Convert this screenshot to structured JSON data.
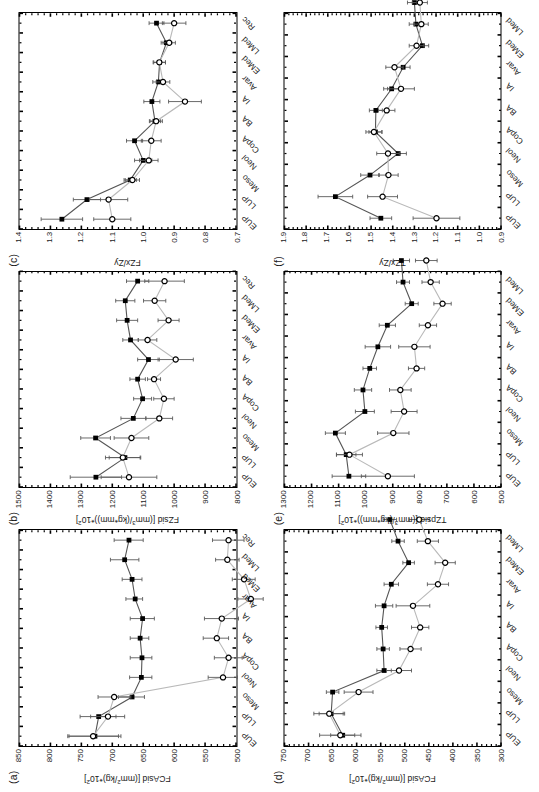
{
  "figure": {
    "rotation_note": "90-deg-ccw",
    "footer_text": "",
    "categories": [
      "EUP",
      "LUP",
      "Meso",
      "Neol",
      "CopA",
      "BA",
      "IA",
      "Avar",
      "EMed",
      "LMed",
      "Rec"
    ],
    "series_legend": [
      {
        "key": "males",
        "marker": "filled-square",
        "color": "#000000"
      },
      {
        "key": "females",
        "marker": "open-circle",
        "color": "#000000"
      }
    ]
  },
  "chart_data": [
    {
      "id": "a",
      "type": "line",
      "tag": "(a)",
      "title": "",
      "xlabel": "",
      "ylabel": "FCAsid [(mm²/kg)*10²]",
      "ylabel_base": "FCAsid [(mm",
      "ylabel_sup": "2",
      "ylabel_tail": "/kg)*10",
      "ylabel_sup2": "2",
      "ylabel_end": "]",
      "ylim": [
        500,
        850
      ],
      "yticks": [
        850,
        800,
        750,
        700,
        650,
        600,
        550,
        500
      ],
      "minor_tick_step": 10,
      "categories": [
        "EUP",
        "LUP",
        "Meso",
        "Neol",
        "CopA",
        "BA",
        "IA",
        "Avar",
        "EMed",
        "LMed",
        "Rec"
      ],
      "grid": false,
      "legend": "none",
      "series": [
        {
          "name": "males",
          "marker": "filled-square",
          "values": [
            728,
            722,
            668,
            653,
            652,
            655,
            651,
            663,
            668,
            680,
            673
          ],
          "err_low": [
            686,
            694,
            648,
            636,
            636,
            641,
            632,
            651,
            652,
            657,
            650
          ],
          "err_high": [
            770,
            752,
            690,
            672,
            671,
            671,
            671,
            678,
            684,
            703,
            697
          ]
        },
        {
          "name": "females",
          "marker": "open-circle",
          "values": [
            731,
            707,
            697,
            521,
            512,
            531,
            523,
            476,
            487,
            514,
            512
          ],
          "err_low": [
            690,
            680,
            670,
            498,
            490,
            512,
            496,
            456,
            469,
            495,
            487
          ],
          "err_high": [
            772,
            735,
            723,
            545,
            535,
            553,
            551,
            497,
            506,
            533,
            538
          ]
        }
      ]
    },
    {
      "id": "b",
      "type": "line",
      "tag": "(b)",
      "title": "",
      "xlabel": "",
      "ylabel": "FZsid [(mm³/(kg*mm))*10²]",
      "ylabel_base": "FZsid [(mm",
      "ylabel_sup": "3",
      "ylabel_tail": "/(kg*mm))*10",
      "ylabel_sup2": "2",
      "ylabel_end": "]",
      "ylim": [
        800,
        1500
      ],
      "yticks": [
        1500,
        1400,
        1300,
        1200,
        1100,
        1000,
        900,
        800
      ],
      "minor_tick_step": 20,
      "categories": [
        "EUP",
        "LUP",
        "Meso",
        "Neol",
        "CopA",
        "BA",
        "IA",
        "Avar",
        "EMed",
        "LMed",
        "Rec"
      ],
      "grid": false,
      "legend": "none",
      "series": [
        {
          "name": "males",
          "marker": "filled-square",
          "values": [
            1253,
            1159,
            1254,
            1132,
            1102,
            1118,
            1083,
            1141,
            1152,
            1158,
            1118
          ],
          "err_low": [
            1170,
            1108,
            1206,
            1092,
            1073,
            1093,
            1048,
            1116,
            1118,
            1127,
            1082
          ],
          "err_high": [
            1336,
            1210,
            1302,
            1172,
            1131,
            1143,
            1118,
            1166,
            1186,
            1189,
            1154
          ]
        },
        {
          "name": "females",
          "marker": "open-circle",
          "values": [
            1146,
            1166,
            1138,
            1048,
            1033,
            1065,
            995,
            1086,
            1018,
            1063,
            1031
          ],
          "err_low": [
            1056,
            1110,
            1082,
            1005,
            1000,
            1044,
            938,
            1056,
            984,
            1027,
            967
          ],
          "err_high": [
            1236,
            1222,
            1194,
            1091,
            1066,
            1086,
            1052,
            1116,
            1052,
            1099,
            1095
          ]
        }
      ]
    },
    {
      "id": "c",
      "type": "line",
      "tag": "(c)",
      "title": "",
      "xlabel": "",
      "ylabel": "FZx/Zy",
      "ylabel_base": "FZx/Zy",
      "ylabel_sup": "",
      "ylabel_tail": "",
      "ylabel_sup2": "",
      "ylabel_end": "",
      "ylim": [
        0.7,
        1.4
      ],
      "yticks": [
        1.4,
        1.3,
        1.2,
        1.1,
        1.0,
        0.9,
        0.8,
        0.7
      ],
      "minor_tick_step": 0.02,
      "categories": [
        "EUP",
        "LUP",
        "Meso",
        "Neol",
        "CopA",
        "BA",
        "IA",
        "Avar",
        "EMed",
        "LMed",
        "Rec"
      ],
      "grid": false,
      "legend": "none",
      "series": [
        {
          "name": "males",
          "marker": "filled-square",
          "values": [
            1.263,
            1.182,
            1.042,
            1.0,
            1.028,
            0.962,
            0.972,
            0.951,
            0.947,
            0.925,
            0.957
          ],
          "err_low": [
            1.196,
            1.138,
            1.022,
            0.972,
            1.002,
            0.944,
            0.946,
            0.933,
            0.928,
            0.908,
            0.933
          ],
          "err_high": [
            1.33,
            1.226,
            1.062,
            1.028,
            1.054,
            0.98,
            0.998,
            0.969,
            0.966,
            0.942,
            0.981
          ]
        },
        {
          "name": "females",
          "marker": "open-circle",
          "values": [
            1.1,
            1.112,
            1.035,
            0.982,
            0.974,
            0.958,
            0.865,
            0.936,
            0.948,
            0.916,
            0.9
          ],
          "err_low": [
            1.04,
            1.05,
            1.012,
            0.952,
            0.942,
            0.938,
            0.812,
            0.914,
            0.928,
            0.896,
            0.862
          ],
          "err_high": [
            1.16,
            1.174,
            1.058,
            1.012,
            1.006,
            0.978,
            0.918,
            0.958,
            0.968,
            0.936,
            0.938
          ]
        }
      ]
    },
    {
      "id": "d",
      "type": "line",
      "tag": "(d)",
      "title": "",
      "xlabel": "",
      "ylabel": "FCAsid [(mm²/kg)*10²]",
      "ylabel_base": "FCAsid [(mm",
      "ylabel_sup": "2",
      "ylabel_tail": "/kg)*10",
      "ylabel_sup2": "2",
      "ylabel_end": "]",
      "ylim": [
        300,
        750
      ],
      "yticks": [
        750,
        700,
        650,
        600,
        550,
        500,
        450,
        400,
        350,
        300
      ],
      "minor_tick_step": 12.5,
      "categories": [
        "EUP",
        "LUP",
        "Meso",
        "Neol",
        "CopA",
        "BA",
        "IA",
        "Avar",
        "EMed",
        "LMed"
      ],
      "grid": false,
      "legend": "none",
      "series": [
        {
          "name": "males",
          "marker": "filled-square",
          "values": [
            629,
            653,
            650,
            543,
            545,
            548,
            543,
            528,
            492,
            514,
            531
          ],
          "err_low": [
            604,
            628,
            637,
            528,
            532,
            536,
            525,
            513,
            480,
            501,
            517
          ],
          "err_high": [
            654,
            678,
            663,
            558,
            558,
            560,
            561,
            543,
            504,
            527,
            545
          ]
        },
        {
          "name": "females",
          "marker": "open-circle",
          "values": [
            634,
            657,
            596,
            512,
            488,
            468,
            483,
            431,
            416,
            452,
            470
          ],
          "err_low": [
            591,
            625,
            566,
            486,
            466,
            450,
            448,
            409,
            395,
            430,
            449
          ],
          "err_high": [
            677,
            689,
            626,
            538,
            510,
            486,
            518,
            453,
            437,
            474,
            491
          ]
        }
      ]
    },
    {
      "id": "e",
      "type": "line",
      "tag": "(e)",
      "title": "",
      "xlabel": "",
      "ylabel": "TZpsid [(mm³/(kg*mm))*10²]",
      "ylabel_base": "TZpsid [(mm",
      "ylabel_sup": "3",
      "ylabel_tail": "/(kg*mm))*10",
      "ylabel_sup2": "2",
      "ylabel_end": "]",
      "ylim": [
        500,
        1300
      ],
      "yticks": [
        1300,
        1200,
        1100,
        1000,
        900,
        800,
        700,
        600,
        500
      ],
      "minor_tick_step": 20,
      "categories": [
        "EUP",
        "LUP",
        "Meso",
        "Neol",
        "CopA",
        "BA",
        "IA",
        "Avar",
        "EMed",
        "LMed"
      ],
      "grid": false,
      "legend": "none",
      "series": [
        {
          "name": "males",
          "marker": "filled-square",
          "values": [
            1062,
            1072,
            1112,
            1003,
            1010,
            985,
            955,
            920,
            830,
            862,
            868
          ],
          "err_low": [
            1000,
            1036,
            1075,
            968,
            978,
            960,
            908,
            890,
            806,
            838,
            838
          ],
          "err_high": [
            1124,
            1108,
            1149,
            1038,
            1042,
            1010,
            1002,
            950,
            854,
            886,
            898
          ]
        },
        {
          "name": "females",
          "marker": "open-circle",
          "values": [
            918,
            1060,
            898,
            858,
            872,
            812,
            820,
            770,
            716,
            760,
            776
          ],
          "err_low": [
            820,
            1012,
            840,
            810,
            832,
            782,
            762,
            738,
            684,
            728,
            736
          ],
          "err_high": [
            1016,
            1108,
            956,
            906,
            912,
            842,
            878,
            802,
            748,
            792,
            816
          ]
        }
      ]
    },
    {
      "id": "f",
      "type": "line",
      "tag": "(f)",
      "title": "",
      "xlabel": "",
      "ylabel": "TZx/Zy",
      "ylabel_base": "TZx/Zy",
      "ylabel_sup": "",
      "ylabel_tail": "",
      "ylabel_sup2": "",
      "ylabel_end": "",
      "ylim": [
        0.9,
        1.9
      ],
      "yticks": [
        1.9,
        1.8,
        1.7,
        1.6,
        1.5,
        1.4,
        1.3,
        1.2,
        1.1,
        1.0,
        0.9
      ],
      "minor_tick_step": 0.025,
      "categories": [
        "EUP",
        "LUP",
        "Meso",
        "Neol",
        "CopA",
        "BA",
        "IA",
        "Avar",
        "EMed",
        "LMed"
      ],
      "grid": false,
      "legend": "none",
      "series": [
        {
          "name": "males",
          "marker": "filled-square",
          "values": [
            1.455,
            1.665,
            1.505,
            1.375,
            1.48,
            1.478,
            1.405,
            1.352,
            1.263,
            1.293,
            1.3
          ],
          "err_low": [
            1.405,
            1.585,
            1.462,
            1.337,
            1.45,
            1.448,
            1.368,
            1.32,
            1.234,
            1.262,
            1.268
          ],
          "err_high": [
            1.505,
            1.745,
            1.548,
            1.413,
            1.51,
            1.508,
            1.442,
            1.384,
            1.292,
            1.324,
            1.332
          ]
        },
        {
          "name": "females",
          "marker": "open-circle",
          "values": [
            1.198,
            1.447,
            1.42,
            1.422,
            1.487,
            1.428,
            1.362,
            1.392,
            1.29,
            1.268,
            1.275
          ],
          "err_low": [
            1.09,
            1.378,
            1.375,
            1.37,
            1.45,
            1.39,
            1.3,
            1.352,
            1.256,
            1.236,
            1.24
          ],
          "err_high": [
            1.306,
            1.516,
            1.465,
            1.474,
            1.524,
            1.466,
            1.424,
            1.432,
            1.324,
            1.3,
            1.31
          ]
        }
      ]
    }
  ]
}
